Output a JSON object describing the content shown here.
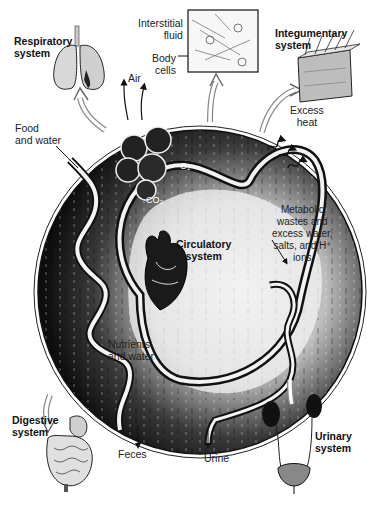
{
  "diagram": {
    "systems": {
      "respiratory": "Respiratory\nsystem",
      "integumentary": "Integumentary\nsystem",
      "circulatory": "Circulatory\nsystem",
      "digestive": "Digestive\nsystem",
      "urinary": "Urinary\nsystem"
    },
    "labels": {
      "interstitial_fluid": "Interstitial\nfluid",
      "body_cells": "Body\ncells",
      "air": "Air",
      "food_and_water": "Food\nand water",
      "o2": "O₂",
      "co2": "CO₂",
      "excess_heat": "Excess\nheat",
      "metabolic_wastes": "Metabolic\nwastes and\nexcess water,\nsalts, and H⁺\nions",
      "nutrients_and_water": "Nutrients\nand water",
      "feces": "Feces",
      "urine": "Urine"
    },
    "colors": {
      "background": "#ffffff",
      "circle_dark": "#141414",
      "tube_light": "#f2f2f2",
      "ink": "#111111"
    }
  }
}
